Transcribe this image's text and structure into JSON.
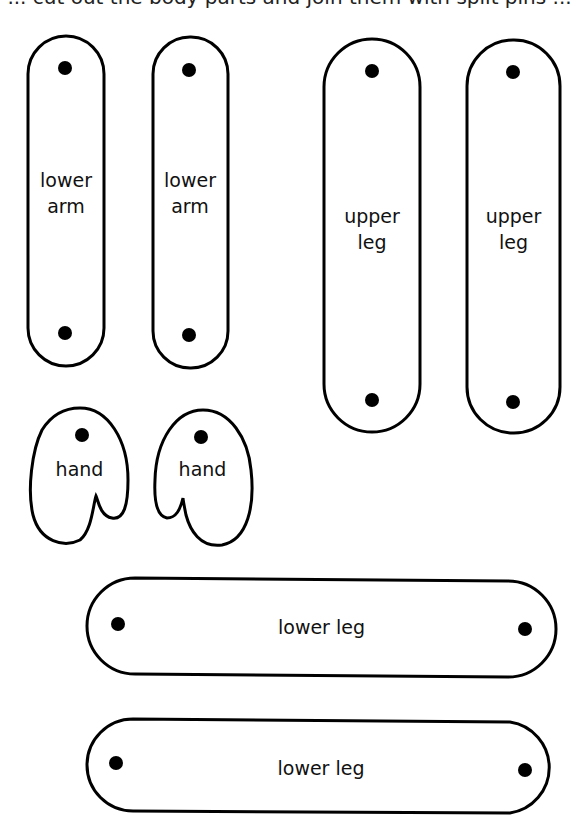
{
  "page": {
    "clipped_title": "... cut out the body parts and join them with split pins ..."
  },
  "colors": {
    "outline": "#000000",
    "background": "#ffffff",
    "hole": "#000000"
  },
  "pieces": [
    {
      "id": "lower-arm-1",
      "label": "lower\narm"
    },
    {
      "id": "lower-arm-2",
      "label": "lower\narm"
    },
    {
      "id": "upper-leg-1",
      "label": "upper\nleg"
    },
    {
      "id": "upper-leg-2",
      "label": "upper\nleg"
    },
    {
      "id": "hand-1",
      "label": "hand"
    },
    {
      "id": "hand-2",
      "label": "hand"
    },
    {
      "id": "lower-leg-1",
      "label": "lower leg"
    },
    {
      "id": "lower-leg-2",
      "label": "lower leg"
    }
  ]
}
